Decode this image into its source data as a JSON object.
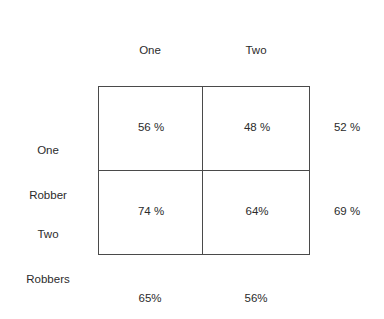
{
  "figure": {
    "type": "contingency-matrix",
    "column_headers": [
      {
        "line1": "One",
        "line2": "Customer"
      },
      {
        "line1": "Two",
        "line2": "Customers"
      }
    ],
    "row_headers": [
      {
        "line1": "One",
        "line2": "Robber"
      },
      {
        "line1": "Two",
        "line2": "Robbers"
      }
    ],
    "cells": [
      [
        "56 %",
        "48 %"
      ],
      [
        "74 %",
        "64%"
      ]
    ],
    "row_margins": [
      "52 %",
      "69 %"
    ],
    "column_margins": [
      "65%",
      "56%"
    ],
    "colors": {
      "background": "#ffffff",
      "text": "#2b2b2b",
      "border": "#4a4a4a"
    }
  },
  "chart_data": {
    "type": "table",
    "title": "",
    "xlabel": "",
    "ylabel": "",
    "row_categories": [
      "One Robber",
      "Two Robbers"
    ],
    "column_categories": [
      "One Customer",
      "Two Customers"
    ],
    "values": [
      [
        56,
        48
      ],
      [
        74,
        64
      ]
    ],
    "value_labels": [
      [
        "56 %",
        "48 %"
      ],
      [
        "74 %",
        "64%"
      ]
    ],
    "row_marginals": [
      52,
      69
    ],
    "row_marginal_labels": [
      "52 %",
      "69 %"
    ],
    "column_marginals": [
      65,
      56
    ],
    "column_marginal_labels": [
      "65%",
      "56%"
    ],
    "units": "percent",
    "grid": true,
    "legend": "none"
  }
}
